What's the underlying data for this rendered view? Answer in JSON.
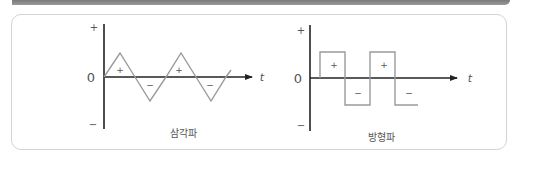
{
  "header": {
    "bar": ""
  },
  "diagrams": [
    {
      "caption": "삼각파",
      "axis": {
        "plus": "+",
        "zero": "0",
        "minus": "−",
        "t": "t"
      },
      "region_labels": [
        "+",
        "−",
        "+",
        "−"
      ]
    },
    {
      "caption": "방형파",
      "axis": {
        "plus": "+",
        "zero": "0",
        "minus": "−",
        "t": "t"
      },
      "region_labels": [
        "+",
        "−",
        "+",
        "−"
      ]
    }
  ],
  "colors": {
    "axis": "#222222",
    "wave": "#9a9a9a",
    "text": "#555555",
    "border": "#d3d3d3",
    "topbar": "#8a8a8a"
  }
}
